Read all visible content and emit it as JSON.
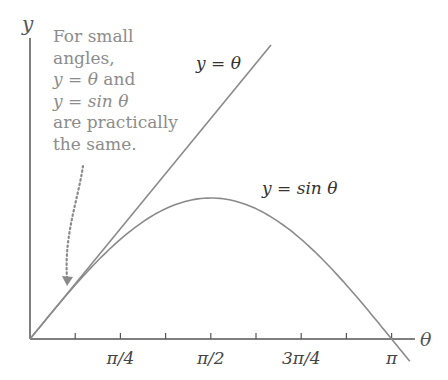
{
  "chart_data": {
    "type": "line",
    "title": "",
    "xlabel": "θ",
    "ylabel": "y",
    "x_ticks": [
      "π/4",
      "π/2",
      "3π/4",
      "π"
    ],
    "x_tick_values": [
      0.785,
      1.571,
      2.356,
      3.142
    ],
    "minor_ticks_every": "π/8",
    "xlim": [
      0,
      3.3
    ],
    "ylim": [
      -0.15,
      2.1
    ],
    "grid": false,
    "series": [
      {
        "name": "y = θ",
        "function": "theta",
        "x_range": [
          0,
          2.09
        ],
        "color": "#8a8a8a"
      },
      {
        "name": "y = sin θ",
        "function": "sin",
        "x_range": [
          0,
          3.3
        ],
        "color": "#8a8a8a"
      }
    ],
    "annotations": [
      {
        "text": "For small angles, y = θ and y = sin θ are practically the same.",
        "arrow_to": [
          0.33,
          0.4
        ]
      }
    ]
  },
  "labels": {
    "y_axis": "y",
    "x_axis": "θ",
    "line_label": "y = θ",
    "sin_label": "y = sin θ",
    "tick_1": "π/4",
    "tick_2": "π/2",
    "tick_3": "3π/4",
    "tick_4": "π"
  },
  "annotation": {
    "line1": "For small",
    "line2": "angles,",
    "line3_a": "y = θ",
    "line3_b": " and",
    "line4": "y = sin θ",
    "line5": "are practically",
    "line6": "the same."
  }
}
